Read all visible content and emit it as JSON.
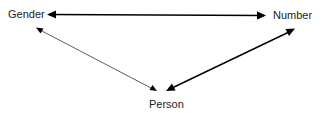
{
  "diagram": {
    "nodes": [
      {
        "id": "gender",
        "label": "Gender"
      },
      {
        "id": "number",
        "label": "Number"
      },
      {
        "id": "person",
        "label": "Person"
      }
    ],
    "edges": [
      {
        "from": "gender",
        "to": "number",
        "direction": "bidirectional",
        "weight": "thick"
      },
      {
        "from": "person",
        "to": "gender",
        "direction": "one-way",
        "weight": "thin"
      },
      {
        "from": "number",
        "to": "person",
        "direction": "bidirectional",
        "weight": "thick"
      }
    ],
    "colors": {
      "line": "#000000",
      "text": "#222222",
      "background": "#ffffff"
    }
  }
}
